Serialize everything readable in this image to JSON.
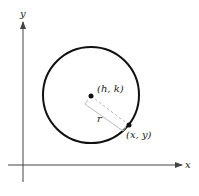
{
  "diagram": {
    "type": "circle-on-coordinate-plane",
    "axes": {
      "x_label": "x",
      "y_label": "y"
    },
    "center_label": "(h, k)",
    "point_label": "(x, y)",
    "radius_label": "r",
    "colors": {
      "stroke": "#111111",
      "axis": "#444444",
      "radius_line": "#bbbbbb"
    }
  }
}
